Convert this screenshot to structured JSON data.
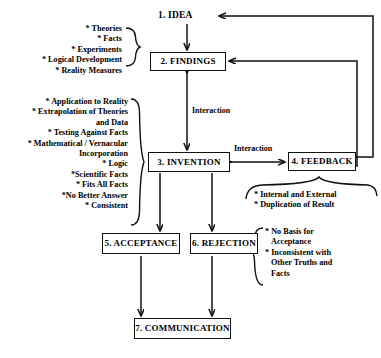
{
  "diagram": {
    "nodes": {
      "idea": "1. IDEA",
      "findings": "2. FINDINGS",
      "invention": "3. INVENTION",
      "feedback": "4. FEEDBACK",
      "acceptance": "5. ACCEPTANCE",
      "rejection": "6. REJECTION",
      "communication": "7. COMMUNICATION"
    },
    "edge_labels": {
      "interaction_vertical": "Interaction",
      "interaction_horizontal": "Interaction"
    },
    "findings_criteria": [
      "* Theories",
      "* Facts",
      "* Experiments",
      "* Logical Development",
      "* Reality Measures"
    ],
    "invention_criteria": [
      "* Application to Reality",
      "*  Extrapolation of Theories",
      "and Data",
      "* Testing Against Facts",
      "* Mathematical / Vernacular",
      "Incorporation",
      "* Logic",
      "*Scientific Facts",
      "* Fits All Facts",
      "*No Better Answer",
      "* Consistent"
    ],
    "feedback_criteria": [
      "* Internal and External",
      "* Duplication of Result"
    ],
    "rejection_criteria": [
      "* No Basis for",
      "Acceptance",
      "* Inconsistent with",
      "Other Truths and",
      "Facts"
    ],
    "colors": {
      "ink": "#111111",
      "background": "#ffffff"
    }
  }
}
